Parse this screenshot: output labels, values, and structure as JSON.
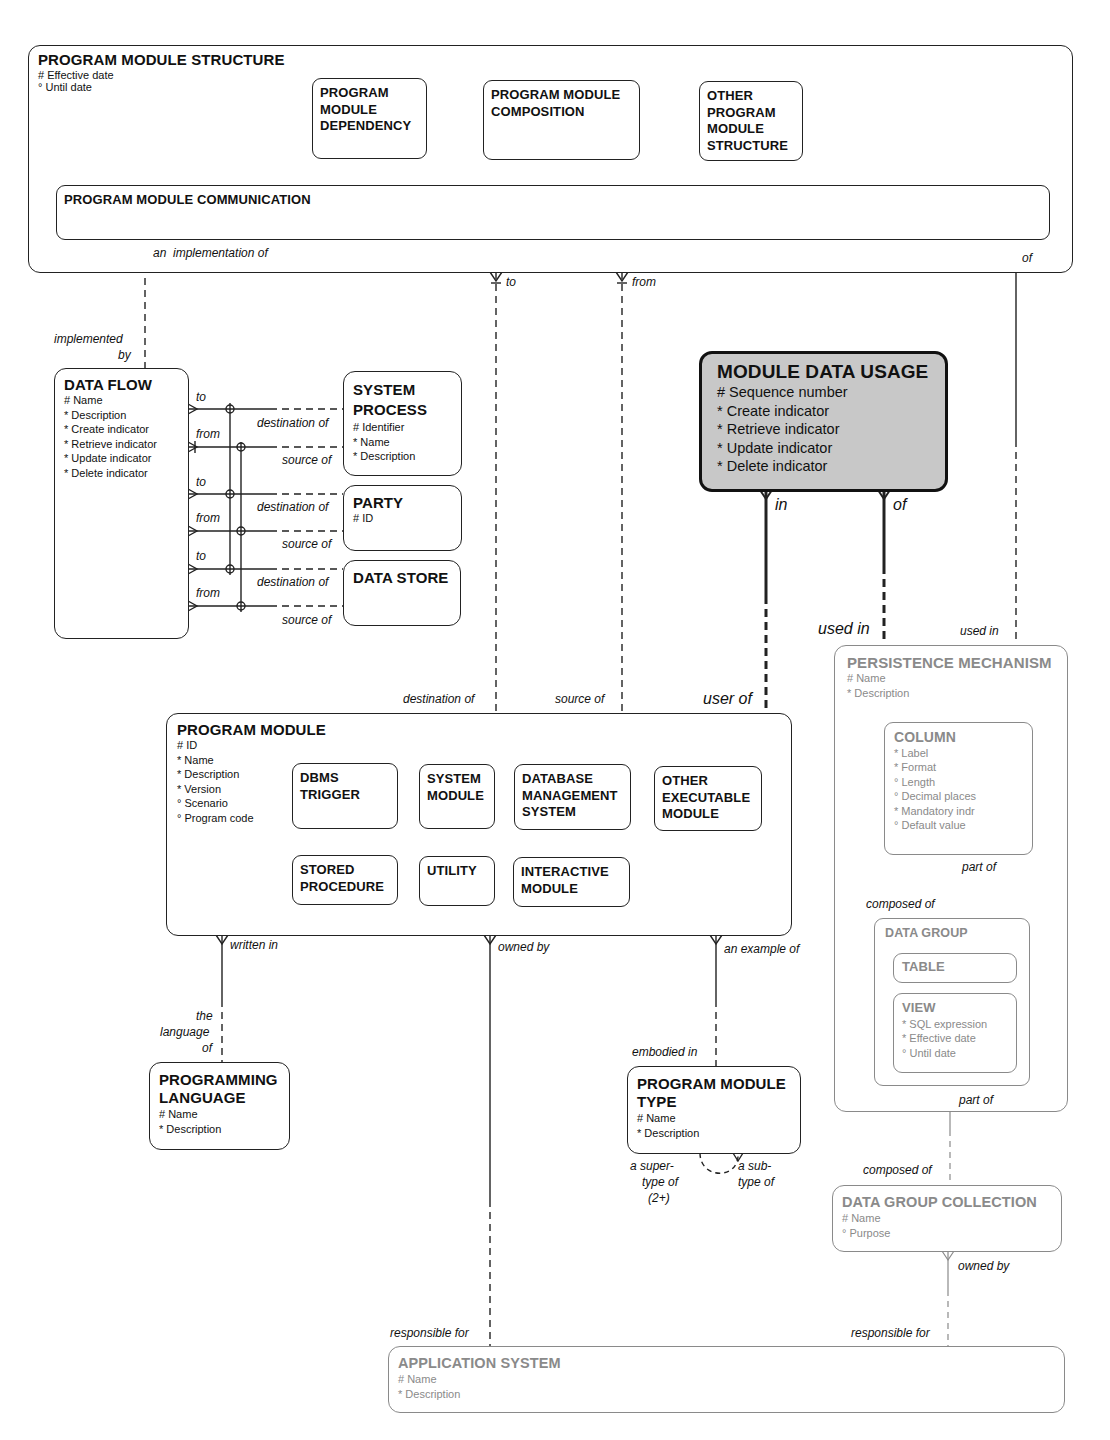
{
  "diagram": {
    "entities": {
      "program_module_structure": {
        "title": "PROGRAM MODULE STRUCTURE",
        "attributes": [
          "# Effective date",
          "° Until date"
        ],
        "subtypes": {
          "dependency": "PROGRAM MODULE DEPENDENCY",
          "composition": "PROGRAM MODULE COMPOSITION",
          "other": "OTHER PROGRAM MODULE STRUCTURE",
          "communication": "PROGRAM MODULE COMMUNICATION"
        }
      },
      "data_flow": {
        "title": "DATA FLOW",
        "attributes": [
          "# Name",
          "* Description",
          "* Create indicator",
          "* Retrieve indicator",
          "* Update indicator",
          "* Delete indicator"
        ]
      },
      "system_process": {
        "title": "SYSTEM PROCESS",
        "attributes": [
          "# Identifier",
          "* Name",
          "* Description"
        ]
      },
      "party": {
        "title": "PARTY",
        "attributes": [
          "# ID"
        ]
      },
      "data_store": {
        "title": "DATA STORE",
        "attributes": []
      },
      "module_data_usage": {
        "title": "MODULE DATA USAGE",
        "attributes": [
          "# Sequence number",
          "* Create indicator",
          "* Retrieve indicator",
          "* Update indicator",
          "* Delete indicator"
        ],
        "fill": "#c8c8c8"
      },
      "persistence_mechanism": {
        "title": "PERSISTENCE MECHANISM",
        "attributes": [
          "# Name",
          "* Description"
        ]
      },
      "column": {
        "title": "COLUMN",
        "attributes": [
          "* Label",
          "* Format",
          "° Length",
          "° Decimal places",
          "* Mandatory indr",
          "° Default value"
        ]
      },
      "data_group": {
        "title": "DATA GROUP",
        "subtypes": {
          "table": "TABLE",
          "view": "VIEW"
        },
        "view_attributes": [
          "* SQL expression",
          "* Effective date",
          "° Until date"
        ]
      },
      "program_module": {
        "title": "PROGRAM MODULE",
        "attributes": [
          "# ID",
          "* Name",
          "* Description",
          "* Version",
          "° Scenario",
          "° Program code"
        ],
        "subtypes": {
          "dbms_trigger": "DBMS TRIGGER",
          "system_module": "SYSTEM MODULE",
          "dbms": "DATABASE MANAGEMENT SYSTEM",
          "other_executable": "OTHER EXECUTABLE MODULE",
          "stored_procedure": "STORED PROCEDURE",
          "utility": "UTILITY",
          "interactive": "INTERACTIVE MODULE"
        }
      },
      "programming_language": {
        "title": "PROGRAMMING LANGUAGE",
        "attributes": [
          "# Name",
          "* Description"
        ]
      },
      "program_module_type": {
        "title": "PROGRAM MODULE TYPE",
        "attributes": [
          "# Name",
          "* Description"
        ]
      },
      "data_group_collection": {
        "title": "DATA GROUP COLLECTION",
        "attributes": [
          "# Name",
          "° Purpose"
        ]
      },
      "application_system": {
        "title": "APPLICATION SYSTEM",
        "attributes": [
          "# Name",
          "* Description"
        ]
      }
    },
    "relationship_labels": {
      "an_implementation_of": "an  implementation of",
      "implemented_by_1": "implemented",
      "implemented_by_2": "by",
      "to": "to",
      "from": "from",
      "of": "of",
      "destination_of": "destination of",
      "source_of": "source of",
      "in": "in",
      "used_in": "used in",
      "user_of": "user of",
      "part_of": "part of",
      "composed_of": "composed of",
      "written_in": "written in",
      "owned_by": "owned by",
      "an_example_of": "an example of",
      "the": "the",
      "language": "language",
      "embodied_in": "embodied in",
      "a_super": "a super-",
      "type_of": "type of",
      "two_plus": "(2+)",
      "a_sub": "a sub-",
      "responsible_for": "responsible for"
    },
    "colors": {
      "line": "#222222",
      "grey_entity": "#8a8a8a",
      "highlight_fill": "#c8c8c8"
    }
  }
}
